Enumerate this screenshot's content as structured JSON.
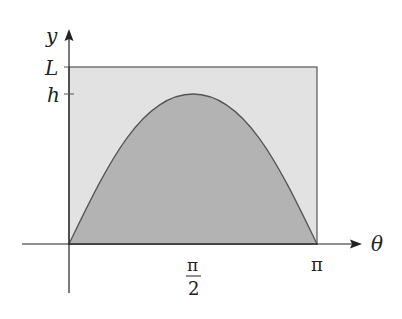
{
  "diagram": {
    "labels": {
      "y_axis": "y",
      "x_axis": "θ",
      "L_tick": "L",
      "h_tick": "h",
      "pi_over_2_num": "π",
      "pi_over_2_den": "2",
      "pi": "π"
    },
    "colors": {
      "rect_fill": "#e2e2e2",
      "curve_fill": "#b3b3b3",
      "stroke": "#555555",
      "axis": "#222222"
    }
  }
}
